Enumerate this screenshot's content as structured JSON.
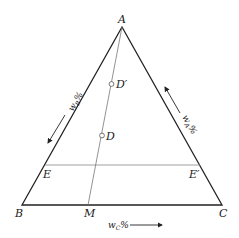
{
  "diagram": {
    "type": "ternary-phase-diagram",
    "vertices": {
      "A": {
        "label": "A"
      },
      "B": {
        "label": "B"
      },
      "C": {
        "label": "C"
      }
    },
    "points": {
      "M": {
        "label": "M"
      },
      "D": {
        "label": "D"
      },
      "D_prime": {
        "label": "D′"
      },
      "E": {
        "label": "E"
      },
      "E_prime": {
        "label": "E′"
      }
    },
    "axes": {
      "left": {
        "label_main": "w",
        "label_sub": "B",
        "label_unit": "%"
      },
      "right": {
        "label_main": "w",
        "label_sub": "A",
        "label_unit": "%"
      },
      "bottom": {
        "label_main": "w",
        "label_sub": "C",
        "label_unit": "%"
      }
    },
    "colors": {
      "stroke": "#222222",
      "thin_line": "#777777",
      "text": "#1a1a1a"
    }
  }
}
